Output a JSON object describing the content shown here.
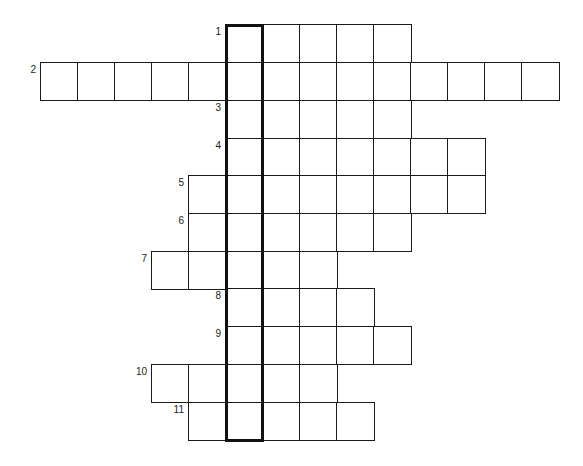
{
  "puzzle": {
    "type": "crossword",
    "highlight_column": 5,
    "cell_size": 37,
    "origin_x": 40,
    "row_top": [
      24,
      62,
      100,
      138,
      175,
      213,
      251,
      288,
      326,
      364,
      402
    ],
    "row_height": 37.6,
    "rows": [
      {
        "number": "1",
        "start_col": 5,
        "end_col": 9
      },
      {
        "number": "2",
        "start_col": 0,
        "end_col": 13
      },
      {
        "number": "3",
        "start_col": 5,
        "end_col": 9
      },
      {
        "number": "4",
        "start_col": 5,
        "end_col": 11
      },
      {
        "number": "5",
        "start_col": 4,
        "end_col": 11
      },
      {
        "number": "6",
        "start_col": 4,
        "end_col": 9
      },
      {
        "number": "7",
        "start_col": 3,
        "end_col": 7
      },
      {
        "number": "8",
        "start_col": 5,
        "end_col": 8
      },
      {
        "number": "9",
        "start_col": 5,
        "end_col": 9
      },
      {
        "number": "10",
        "start_col": 3,
        "end_col": 7
      },
      {
        "number": "11",
        "start_col": 4,
        "end_col": 8
      }
    ],
    "colors": {
      "line": "#1a1a1a",
      "background": "#ffffff",
      "number": "#222222"
    }
  }
}
